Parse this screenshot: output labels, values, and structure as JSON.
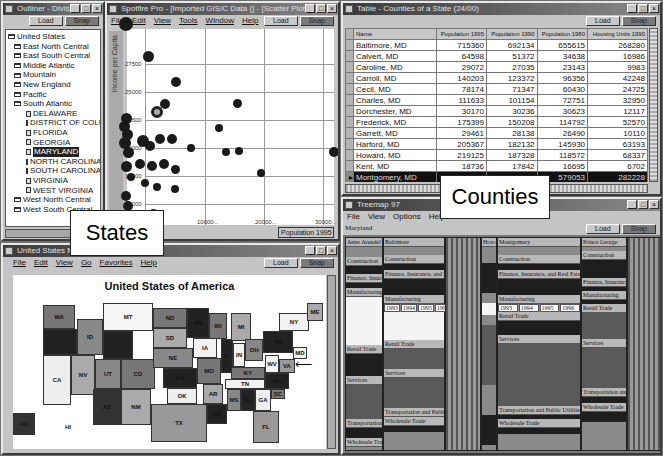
{
  "outliner": {
    "title": "Outliner - Divisi...",
    "load": "Load",
    "snap": "Snap",
    "root": "United States",
    "divisions": [
      {
        "label": "East North Central"
      },
      {
        "label": "East South Central"
      },
      {
        "label": "Middle Atlantic"
      },
      {
        "label": "Mountain"
      },
      {
        "label": "New England"
      },
      {
        "label": "Pacific"
      },
      {
        "label": "South Atlantic",
        "expanded": true
      },
      {
        "label": "West North Central"
      },
      {
        "label": "West South Central"
      }
    ],
    "south_atlantic_states": [
      "DELAWARE",
      "DISTRICT OF COLU",
      "FLORIDA",
      "GEORGIA",
      "MARYLAND",
      "NORTH CAROLINA",
      "SOUTH CAROLINA",
      "VIRGINIA",
      "WEST VIRGINIA"
    ],
    "selected": "MARYLAND"
  },
  "scatter": {
    "title": "Spotfire Pro - [Imported GIS/C Data (] - [Scatter Plot]",
    "menu": [
      "File",
      "Edit",
      "View",
      "Tools",
      "Window",
      "Help"
    ],
    "load": "Load",
    "snap": "Snap",
    "y_axis_label": "Income per Capita",
    "y_ticks": [
      "27500",
      "25000",
      "22500",
      "20000",
      "17500",
      "15000"
    ],
    "x_ticks": [
      "10000...",
      "20000...",
      "30000..."
    ],
    "x_axis_select": "Population 1995"
  },
  "table": {
    "title": "Table - Counties of a State (24/00)",
    "load": "Load",
    "snap": "Snap",
    "columns": [
      "Name",
      "Population 1995",
      "Population 1990",
      "Population 1980",
      "Housing Units 1990"
    ],
    "rows": [
      [
        "Baltimore, MD",
        "715360",
        "692134",
        "655615",
        "268280"
      ],
      [
        "Calvert, MD",
        "64598",
        "51372",
        "34638",
        "16986"
      ],
      [
        "Caroline, MD",
        "29072",
        "27035",
        "23143",
        "9983"
      ],
      [
        "Carroll, MD",
        "140203",
        "123372",
        "96356",
        "42248"
      ],
      [
        "Cecil, MD",
        "78174",
        "71347",
        "60430",
        "24725"
      ],
      [
        "Charles, MD",
        "111633",
        "101154",
        "72751",
        "32950"
      ],
      [
        "Dorchester, MD",
        "30170",
        "30236",
        "30623",
        "12117"
      ],
      [
        "Frederick, MD",
        "175399",
        "150208",
        "114792",
        "52570"
      ],
      [
        "Garrett, MD",
        "29461",
        "28138",
        "26490",
        "10110"
      ],
      [
        "Harford, MD",
        "205367",
        "182132",
        "145930",
        "63193"
      ],
      [
        "Howard, MD",
        "219125",
        "187328",
        "118572",
        "68337"
      ],
      [
        "Kent, MD",
        "18736",
        "17842",
        "16695",
        "6702"
      ],
      [
        "Montgomery, MD",
        "809569",
        "757027",
        "579053",
        "282228"
      ],
      [
        "Prince George's, MD",
        "767413",
        "728553",
        "665071",
        "258011"
      ],
      [
        "Queen Anne's, MD",
        "36992",
        "33953",
        "25508",
        "12489"
      ],
      [
        "Somerset, MD",
        "",
        "",
        "19188",
        "7977"
      ]
    ],
    "highlighted_row": 12
  },
  "map": {
    "title": "United States M...",
    "menu": [
      "File",
      "Edit",
      "View",
      "Go",
      "Favorites",
      "Help"
    ],
    "load": "Load",
    "snap": "Snap",
    "heading": "United States of America"
  },
  "treemap": {
    "title": "Treemap 97",
    "menu": [
      "File",
      "View",
      "Options",
      "Help"
    ],
    "load": "Load",
    "snap": "Snap",
    "breadcrumb": "Maryland",
    "counties": [
      "Anne Arundel",
      "Baltimore",
      "Howard",
      "Montgomery",
      "Prince George"
    ],
    "sectors": [
      "Construction",
      "Finance, Insurance, and Real Estate",
      "Manufacturing",
      "Retail Trade",
      "Services",
      "Transportation and Public Utilities",
      "Wholesale Trade"
    ],
    "years": [
      "1993",
      "1994",
      "1995",
      "1996"
    ]
  },
  "callouts": {
    "states": "States",
    "counties": "Counties"
  }
}
